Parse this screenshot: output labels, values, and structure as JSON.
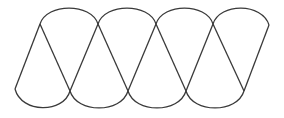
{
  "diagram": {
    "type": "interlaced-arc-ribbon",
    "stroke_color": "#3a3a3a",
    "background_color": "#ffffff",
    "stroke_width": 1.3,
    "top_points": [
      [
        40,
        24
      ],
      [
        98,
        24
      ],
      [
        156,
        24
      ],
      [
        213,
        24
      ],
      [
        269,
        25
      ]
    ],
    "bottom_points": [
      [
        15,
        89
      ],
      [
        70,
        91
      ],
      [
        128,
        91
      ],
      [
        186,
        91
      ],
      [
        244,
        91
      ]
    ],
    "top_arc_peak_y": 8,
    "bottom_arc_low_y": 108,
    "labels": []
  }
}
